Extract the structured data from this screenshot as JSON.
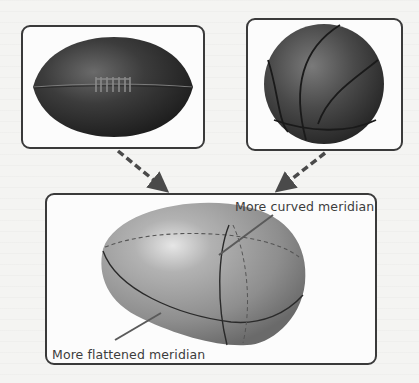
{
  "figure": {
    "panels": [
      {
        "id": "football",
        "subject": "rugby-football-icon",
        "description": "Leather rugby/American football with laces"
      },
      {
        "id": "basketball",
        "subject": "basketball-icon",
        "description": "Dark basketball with seams"
      },
      {
        "id": "ellipsoid",
        "subject": "egg-shaped-ellipsoid-icon",
        "description": "Asymmetric ellipsoid with meridians"
      }
    ],
    "labels": {
      "curved_meridian": "More curved meridian",
      "flattened_meridian": "More flattened meridian"
    },
    "arrows": [
      {
        "from": "football",
        "to": "ellipsoid",
        "style": "dashed"
      },
      {
        "from": "basketball",
        "to": "ellipsoid",
        "style": "dashed"
      }
    ],
    "colors": {
      "frame": "#3a3a3a",
      "arrow": "#4a4a4a",
      "ball_dark": "#2e2e2e",
      "ellipsoid": "#9a9a9a",
      "text": "#3c3c3c"
    }
  }
}
